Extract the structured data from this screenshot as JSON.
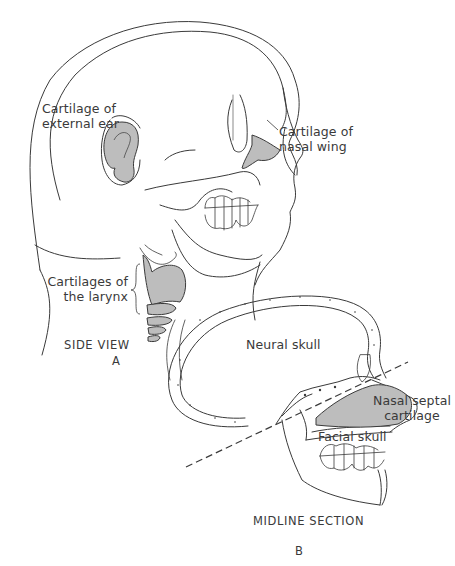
{
  "figure": {
    "panel_a": {
      "caption": "SIDE VIEW",
      "letter": "A",
      "labels": {
        "external_ear": "Cartilage of\nexternal ear",
        "nasal_wing": "Cartilage of\nnasal wing",
        "larynx": "Cartilages of\nthe larynx"
      }
    },
    "panel_b": {
      "caption": "MIDLINE SECTION",
      "letter": "B",
      "labels": {
        "neural_skull": "Neural skull",
        "nasal_septal": "Nasal septal\ncartilage",
        "facial_skull": "Facial skull"
      }
    },
    "colors": {
      "line": "#3a3a3a",
      "cartilage_fill": "#bdbdbd",
      "background": "#ffffff"
    }
  }
}
